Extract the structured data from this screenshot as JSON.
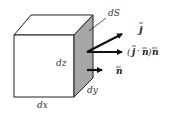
{
  "diagram": {
    "labels": {
      "dS": "dS",
      "dz": "dz",
      "dy": "dy",
      "dx": "dx"
    },
    "vectors": {
      "j": "j",
      "projection_open": "(",
      "projection_j": "j",
      "projection_dot": "·",
      "projection_n": "n",
      "projection_close": ")",
      "projection_n2": "n",
      "n": "n"
    },
    "colors": {
      "edge": "#222222",
      "shaded_face": "#a6a6a6",
      "arrow": "#111111",
      "text": "#333333"
    }
  }
}
